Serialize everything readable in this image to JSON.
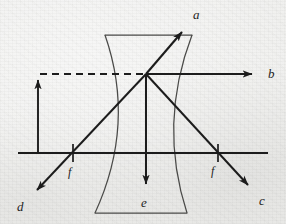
{
  "figure": {
    "kind": "optics-ray-diagram",
    "width": 286,
    "height": 224,
    "background_color": "#ededeb",
    "ink_color": "#1c1c1c",
    "lens_outline_color": "#4a4a48"
  },
  "optical_axis": {
    "label": "optical-axis",
    "y": 153,
    "x_start": 18,
    "x_end": 268
  },
  "lens": {
    "label": "diverging-lens",
    "top_y": 35,
    "bottom_y": 213,
    "top_left_x": 105,
    "top_right_x": 192,
    "bottom_left_x": 95,
    "bottom_right_x": 187,
    "left_arc_vertex_x": 128,
    "right_arc_vertex_x": 166,
    "center_x": 146
  },
  "object": {
    "name": "object-arrow",
    "x": 38,
    "base_y": 153,
    "tip_y": 74
  },
  "dashed_ray": {
    "name": "incident-parallel-ray",
    "x_start": 40,
    "x_end": 145,
    "y": 74,
    "style": "dashed"
  },
  "node": {
    "name": "ray-junction",
    "x": 146,
    "y": 74
  },
  "focal_points": [
    {
      "id": "f-left",
      "label": "f",
      "x": 73,
      "tick_y": 153,
      "label_x": 68,
      "label_y": 172
    },
    {
      "id": "f-right",
      "label": "f",
      "x": 218,
      "tick_y": 153,
      "label_x": 211,
      "label_y": 171
    }
  ],
  "rays": [
    {
      "id": "ray-a",
      "label": "a",
      "from_x": 146,
      "from_y": 74,
      "to_x": 186,
      "to_y": 27,
      "label_x": 193,
      "label_y": 8,
      "arrowhead": true
    },
    {
      "id": "ray-b",
      "label": "b",
      "from_x": 146,
      "from_y": 74,
      "to_x": 258,
      "to_y": 74,
      "label_x": 268,
      "label_y": 67,
      "arrowhead": true
    },
    {
      "id": "ray-c",
      "label": "c",
      "from_x": 146,
      "from_y": 74,
      "to_x": 253,
      "to_y": 190,
      "label_x": 259,
      "label_y": 194,
      "arrowhead": true
    },
    {
      "id": "ray-d",
      "label": "d",
      "from_x": 146,
      "from_y": 74,
      "to_x": 32,
      "to_y": 195,
      "label_x": 17,
      "label_y": 200,
      "arrowhead": true
    },
    {
      "id": "ray-e",
      "label": "e",
      "from_x": 146,
      "from_y": 74,
      "to_x": 146,
      "to_y": 190,
      "label_x": 141,
      "label_y": 196,
      "arrowhead": true
    }
  ]
}
